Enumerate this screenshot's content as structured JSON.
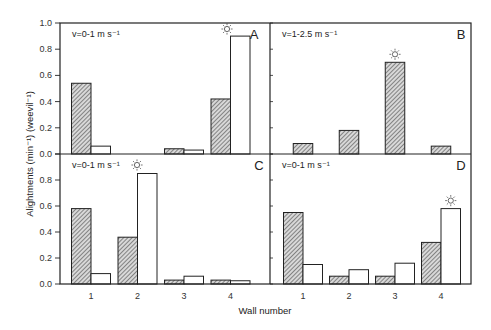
{
  "chart_data": {
    "type": "bar",
    "title": "",
    "xlabel": "Wall number",
    "ylabel": "Alightments (min⁻¹) (weevil⁻¹)",
    "ylim": [
      0,
      1.0
    ],
    "yticks": [
      "0.0",
      "0.2",
      "0.4",
      "0.6",
      "0.8",
      "1.0"
    ],
    "categories": [
      "1",
      "2",
      "3",
      "4"
    ],
    "grid": false,
    "legend": "none (hatched = series 1, open = series 2)",
    "panels": [
      {
        "id": "A",
        "condition": "v=0-1 m s⁻¹",
        "sun_marker_on_wall": "4",
        "series": [
          {
            "name": "hatched",
            "values": [
              0.54,
              null,
              0.04,
              0.42
            ]
          },
          {
            "name": "open",
            "values": [
              0.06,
              null,
              0.03,
              0.9
            ]
          }
        ]
      },
      {
        "id": "B",
        "condition": "v=1-2.5 m s⁻¹",
        "sun_marker_on_wall": "3",
        "series": [
          {
            "name": "hatched",
            "values": [
              0.08,
              0.18,
              0.7,
              0.06
            ]
          }
        ]
      },
      {
        "id": "C",
        "condition": "v=0-1 m s⁻¹",
        "sun_marker_on_wall": "2",
        "series": [
          {
            "name": "hatched",
            "values": [
              0.58,
              0.36,
              0.03,
              0.03
            ]
          },
          {
            "name": "open",
            "values": [
              0.08,
              0.85,
              0.06,
              0.025
            ]
          }
        ]
      },
      {
        "id": "D",
        "condition": "v=0-1 m s⁻¹",
        "sun_marker_on_wall": "4",
        "series": [
          {
            "name": "hatched",
            "values": [
              0.55,
              0.06,
              0.06,
              0.32
            ]
          },
          {
            "name": "open",
            "values": [
              0.15,
              0.11,
              0.16,
              0.58
            ]
          }
        ]
      }
    ]
  },
  "colors": {
    "axis": "#222222",
    "bar_outline": "#222222",
    "hatch_fill": "#777777",
    "open_fill": "#ffffff",
    "sun": "#555555"
  }
}
